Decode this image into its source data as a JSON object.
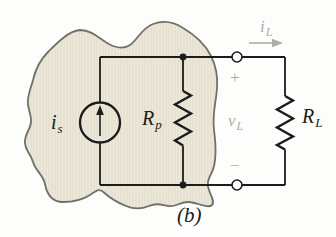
{
  "figure": {
    "type": "circuit-diagram",
    "caption": "(b)",
    "colors": {
      "wire": "#1c1c1c",
      "blob_fill": "#ece8da",
      "blob_stripe": "#e0dac8",
      "blob_outline": "#70706a",
      "gray_label": "#adaca8",
      "background": "#fdfdfc"
    },
    "components": {
      "current_source": {
        "label": {
          "main": "i",
          "sub": "s"
        }
      },
      "parallel_resistor": {
        "label": {
          "main": "R",
          "sub": "p"
        }
      },
      "load_resistor": {
        "label": {
          "main": "R",
          "sub": "L"
        }
      },
      "load_voltage": {
        "label": {
          "main": "v",
          "sub": "L"
        },
        "plus": "+",
        "minus": "−"
      },
      "load_current": {
        "label": {
          "main": "i",
          "sub": "L"
        }
      }
    }
  }
}
